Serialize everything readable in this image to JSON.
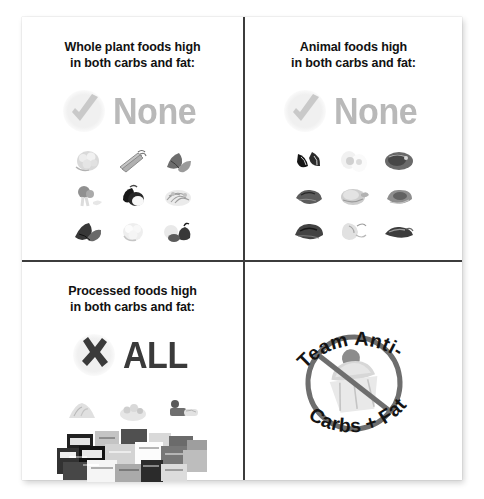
{
  "page": {
    "background_color": "#ffffff",
    "card_color": "#ffffff",
    "divider_color": "#3c3c3c"
  },
  "quadrants": {
    "top_left": {
      "title_line1": "Whole plant foods high",
      "title_line2": "in both carbs and fat:",
      "verdict_mark": "check-mark",
      "verdict_word": "None",
      "verdict_color": "#b9b9b9",
      "foods": [
        "cauliflower",
        "celery-stalks",
        "leafy-greens",
        "broccoli",
        "eggplant",
        "sprouts",
        "kale",
        "cauliflower-head",
        "squash-and-peppers"
      ]
    },
    "top_right": {
      "title_line1": "Animal foods high",
      "title_line2": "in both carbs and fat:",
      "verdict_mark": "check-mark",
      "verdict_word": "None",
      "verdict_color": "#b9b9b9",
      "foods": [
        "mussels",
        "eggs",
        "fish-fillet",
        "raw-steak",
        "roast-chicken",
        "pork-chop",
        "beef-cuts",
        "shrimp",
        "bacon-strips"
      ]
    },
    "bottom_left": {
      "title_line1": "Processed foods high",
      "title_line2": "in both carbs and fat:",
      "verdict_mark": "x-mark",
      "verdict_word": "ALL",
      "verdict_color": "#3a3a3a",
      "loose_items": [
        "potato-chips-pile",
        "snack-mix-pile",
        "candy-bar"
      ],
      "collage_label": "packaged-snack-foods-collage"
    },
    "bottom_right": {
      "logo": {
        "top_arc_text": "Team Anti-",
        "bottom_arc_text": "Carbs + Fat",
        "symbol": "no-cupcake-prohibition-sign",
        "ring_color": "#6e6e6e",
        "text_color": "#141414"
      }
    }
  }
}
